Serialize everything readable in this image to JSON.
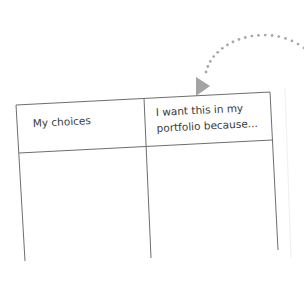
{
  "worksheet": {
    "table": {
      "headers": [
        {
          "lines": [
            "My choices"
          ]
        },
        {
          "lines": [
            "I want this in my",
            "portfolio because..."
          ]
        }
      ],
      "rows": [
        [
          "",
          ""
        ]
      ]
    },
    "arrow": {
      "style": "dotted-curve",
      "points_to": "table-header",
      "color": "#a8a8a8"
    },
    "colors": {
      "line": "#6e6e6e",
      "text": "#3a3a3a",
      "arrow": "#a8a8a8",
      "background": "#ffffff"
    }
  }
}
